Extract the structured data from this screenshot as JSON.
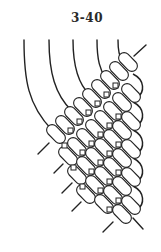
{
  "figure": {
    "label": "3-40",
    "stroke_color": "#222222",
    "bead_fill": "#ffffff",
    "thread_count": 5,
    "lower_left_tail_count": 5
  }
}
